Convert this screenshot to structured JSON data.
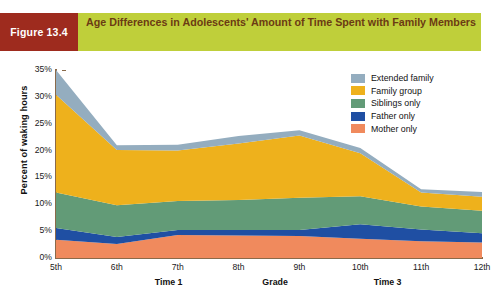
{
  "header": {
    "figure_tag": "Figure 13.4",
    "title": "Age Differences in Adolescents' Amount of Time Spent with Family Members",
    "band_color": "#bfcf3a",
    "tag_color": "#9e2b1e",
    "title_color": "#6b3b14"
  },
  "legend": {
    "position": "top-right",
    "items": [
      {
        "label": "Extended family",
        "color": "#94adbf"
      },
      {
        "label": "Family group",
        "color": "#eeb11c"
      },
      {
        "label": "Siblings only",
        "color": "#629b77"
      },
      {
        "label": "Father only",
        "color": "#1f4fa3"
      },
      {
        "label": "Mother only",
        "color": "#f08a5d"
      }
    ]
  },
  "axes": {
    "y_title": "Percent of waking hours",
    "y_ticks": [
      "0%",
      "5%",
      "10%",
      "15%",
      "20%",
      "25%",
      "30%",
      "35%"
    ],
    "x_title": "Grade",
    "x_groups": [
      "Time 1",
      "Grade",
      "Time 3"
    ]
  },
  "chart_data": {
    "type": "area",
    "title": "Age Differences in Adolescents' Amount of Time Spent with Family Members",
    "xlabel": "Grade",
    "ylabel": "Percent of waking hours",
    "ylim": [
      0,
      35
    ],
    "grid": false,
    "stacked": true,
    "legend_position": "top-right",
    "categories": [
      "5th",
      "6th",
      "7th",
      "8th",
      "9th",
      "10th",
      "11th",
      "12th"
    ],
    "series": [
      {
        "name": "Mother only",
        "color": "#f08a5d",
        "values": [
          3.4,
          2.6,
          4.3,
          4.2,
          4.1,
          3.6,
          3.1,
          2.9
        ]
      },
      {
        "name": "Father only",
        "color": "#1f4fa3",
        "values": [
          2.2,
          1.3,
          0.9,
          1.0,
          1.1,
          2.7,
          2.2,
          1.7
        ]
      },
      {
        "name": "Siblings only",
        "color": "#629b77",
        "values": [
          6.6,
          5.9,
          5.4,
          5.6,
          6.0,
          5.2,
          4.3,
          4.2
        ]
      },
      {
        "name": "Family group",
        "color": "#eeb11c",
        "values": [
          18.2,
          10.3,
          9.4,
          10.5,
          11.6,
          8.0,
          2.6,
          2.6
        ]
      },
      {
        "name": "Extended family",
        "color": "#94adbf",
        "values": [
          4.6,
          0.9,
          1.1,
          1.4,
          1.0,
          1.0,
          0.6,
          0.9
        ]
      }
    ],
    "totals": [
      35.0,
      21.0,
      21.1,
      22.7,
      23.8,
      20.5,
      12.8,
      12.3
    ]
  }
}
